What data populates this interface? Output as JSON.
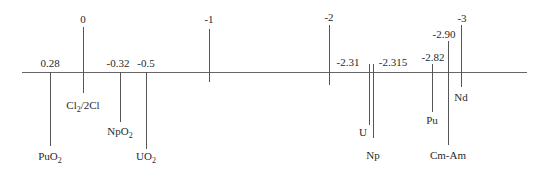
{
  "diagram": {
    "axis_scale_ticks": [
      {
        "value": "0",
        "label": "0",
        "couple": "Cl2/2Cl",
        "couple_parts": [
          "Cl",
          "2",
          "/2Cl"
        ]
      },
      {
        "value": "-1",
        "label": "-1"
      },
      {
        "value": "-2",
        "label": "-2"
      },
      {
        "value": "-3",
        "label": "-3",
        "couple": "Nd",
        "couple_parts": [
          "Nd",
          "",
          ""
        ]
      }
    ],
    "couples": [
      {
        "id": "puo2",
        "potential_label": "0.28",
        "name": "PuO2",
        "name_parts": [
          "PuO",
          "2",
          ""
        ]
      },
      {
        "id": "npo2",
        "potential_label": "-0.32",
        "name": "NpO2",
        "name_parts": [
          "NpO",
          "2",
          ""
        ]
      },
      {
        "id": "uo2",
        "potential_label": "-0.5",
        "name": "UO2",
        "name_parts": [
          "UO",
          "2",
          ""
        ]
      },
      {
        "id": "u",
        "potential_label": "-2.31",
        "name": "U",
        "name_parts": [
          "U",
          "",
          ""
        ]
      },
      {
        "id": "np",
        "potential_label": "-2.315",
        "name": "Np",
        "name_parts": [
          "Np",
          "",
          ""
        ]
      },
      {
        "id": "pu",
        "potential_label": "-2.82",
        "name": "Pu",
        "name_parts": [
          "Pu",
          "",
          ""
        ]
      },
      {
        "id": "cmam",
        "potential_label": "-2.90",
        "name": "Cm-Am",
        "name_parts": [
          "Cm-Am",
          "",
          ""
        ]
      }
    ]
  }
}
